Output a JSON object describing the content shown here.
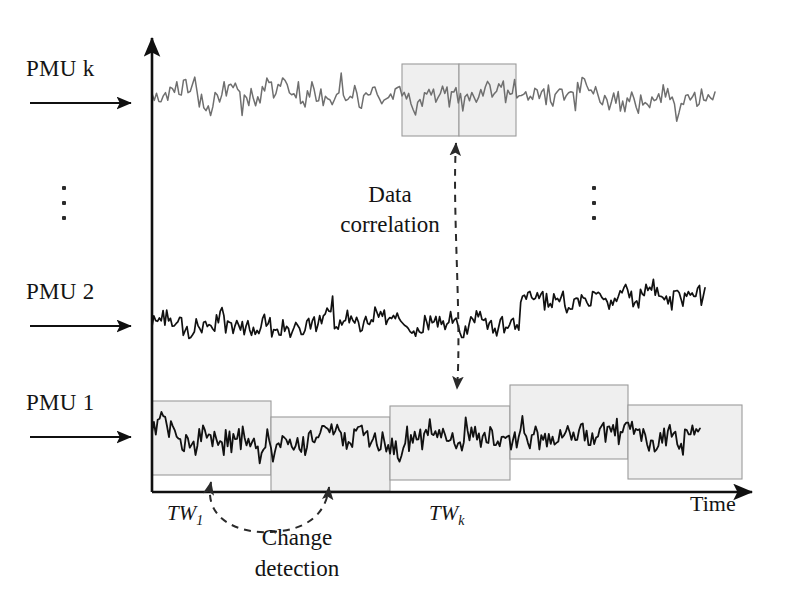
{
  "figure": {
    "background": "#ffffff",
    "axis_color": "#101010",
    "width": 794,
    "height": 606
  },
  "labels": {
    "pmu_k": "PMU k",
    "pmu_2": "PMU 2",
    "pmu_1": "PMU 1",
    "data_correlation_line1": "Data",
    "data_correlation_line2": "correlation",
    "change_detection_line1": "Change",
    "change_detection_line2": "detection",
    "tw_first": "TW",
    "tw_first_sub": "1",
    "tw_k": "TW",
    "tw_k_sub": "k",
    "time_axis": "Time",
    "vertical_ellipsis_left": "⋮",
    "vertical_ellipsis_right": "⋮"
  },
  "colors": {
    "signal_dark": "#111111",
    "signal_gray": "#6f6f6f",
    "window_fill": "#eeeeee",
    "window_stroke": "#9b9b9b",
    "axis": "#101010",
    "dashed_arrow": "#2a2a2a"
  },
  "chart_data": {
    "type": "line",
    "xlabel": "Time",
    "ylabel": "",
    "grid": false,
    "legend": "none",
    "x_axis": {
      "x_start": 152,
      "x_end": 757,
      "y": 492,
      "arrow": true
    },
    "y_axis": {
      "x": 152,
      "y_start": 32,
      "y_end": 492,
      "arrow": true
    },
    "series": [
      {
        "name": "PMU k",
        "color": "#6f6f6f",
        "baseline_y": 95,
        "amplitude": 26,
        "x_start": 152,
        "x_end": 715,
        "samples": 250,
        "seed": 1307,
        "level_shift": null
      },
      {
        "name": "PMU 2",
        "color": "#111111",
        "baseline_y": 325,
        "amplitude": 24,
        "x_start": 152,
        "x_end": 705,
        "samples": 300,
        "seed": 8821,
        "level_shift": {
          "x": 520,
          "delta_y": -26
        }
      },
      {
        "name": "PMU 1",
        "color": "#111111",
        "baseline_y": 437,
        "amplitude": 26,
        "x_start": 152,
        "x_end": 700,
        "samples": 290,
        "seed": 4493,
        "level_shift": null
      }
    ],
    "time_windows": [
      {
        "row": "PMU 1",
        "label": "TW_1",
        "x": 152,
        "y": 401,
        "w": 119,
        "h": 74
      },
      {
        "row": "PMU 1",
        "label": "",
        "x": 271,
        "y": 417,
        "w": 119,
        "h": 74
      },
      {
        "row": "PMU 1",
        "label": "TW_k",
        "x": 390,
        "y": 406,
        "w": 120,
        "h": 74
      },
      {
        "row": "PMU 1",
        "label": "",
        "x": 510,
        "y": 385,
        "w": 118,
        "h": 74
      },
      {
        "row": "PMU 1",
        "label": "",
        "x": 628,
        "y": 405,
        "w": 114,
        "h": 74
      },
      {
        "row": "PMU k",
        "label": "",
        "x": 402,
        "y": 64,
        "w": 57,
        "h": 72
      },
      {
        "row": "PMU k",
        "label": "",
        "x": 459,
        "y": 64,
        "w": 57,
        "h": 72
      }
    ],
    "annotations": [
      {
        "name": "data-correlation",
        "type": "dashed-double-arrow-vertical",
        "x": 456,
        "y_top": 140,
        "y_bottom": 392
      },
      {
        "name": "change-detection",
        "type": "dashed-double-arrow-curve",
        "x_left": 209,
        "x_right": 326,
        "y": 505
      }
    ],
    "pmu_arrows": [
      {
        "label": "PMU k",
        "x1": 30,
        "x2": 134,
        "y": 103
      },
      {
        "label": "PMU 2",
        "x1": 30,
        "x2": 134,
        "y": 326
      },
      {
        "label": "PMU 1",
        "x1": 30,
        "x2": 134,
        "y": 437
      }
    ]
  }
}
